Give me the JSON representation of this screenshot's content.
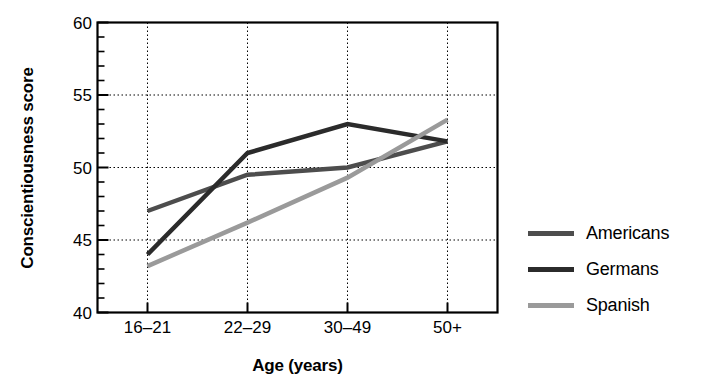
{
  "chart_data": {
    "type": "line",
    "title": "",
    "xlabel": "Age (years)",
    "ylabel": "Conscientiousness score",
    "categories": [
      "16–21",
      "22–29",
      "30–49",
      "50+"
    ],
    "ylim": [
      40,
      60
    ],
    "ytick_labels": [
      "40",
      "45",
      "50",
      "55",
      "60"
    ],
    "ytick_values": [
      40,
      45,
      50,
      55,
      60
    ],
    "ytick_minor_step": 1,
    "grid": "dotted-both",
    "legend_position": "right",
    "series": [
      {
        "name": "Americans",
        "color": "#4d4d4d",
        "values": [
          47.0,
          49.5,
          50.0,
          51.8
        ]
      },
      {
        "name": "Germans",
        "color": "#2b2b2b",
        "values": [
          44.0,
          51.0,
          53.0,
          51.8
        ]
      },
      {
        "name": "Spanish",
        "color": "#9a9a9a",
        "values": [
          43.2,
          46.2,
          49.3,
          53.3
        ]
      }
    ]
  },
  "axes": {
    "y_label": "Conscientiousness score",
    "x_label": "Age (years)",
    "y_ticks": [
      {
        "label": "60",
        "value": 60
      },
      {
        "label": "55",
        "value": 55
      },
      {
        "label": "50",
        "value": 50
      },
      {
        "label": "45",
        "value": 45
      },
      {
        "label": "40",
        "value": 40
      }
    ],
    "x_ticks": [
      {
        "label": "16–21"
      },
      {
        "label": "22–29"
      },
      {
        "label": "30–49"
      },
      {
        "label": "50+"
      }
    ]
  },
  "legend": {
    "items": [
      {
        "label": "Americans",
        "color": "#4d4d4d"
      },
      {
        "label": "Germans",
        "color": "#2b2b2b"
      },
      {
        "label": "Spanish",
        "color": "#9a9a9a"
      }
    ]
  }
}
